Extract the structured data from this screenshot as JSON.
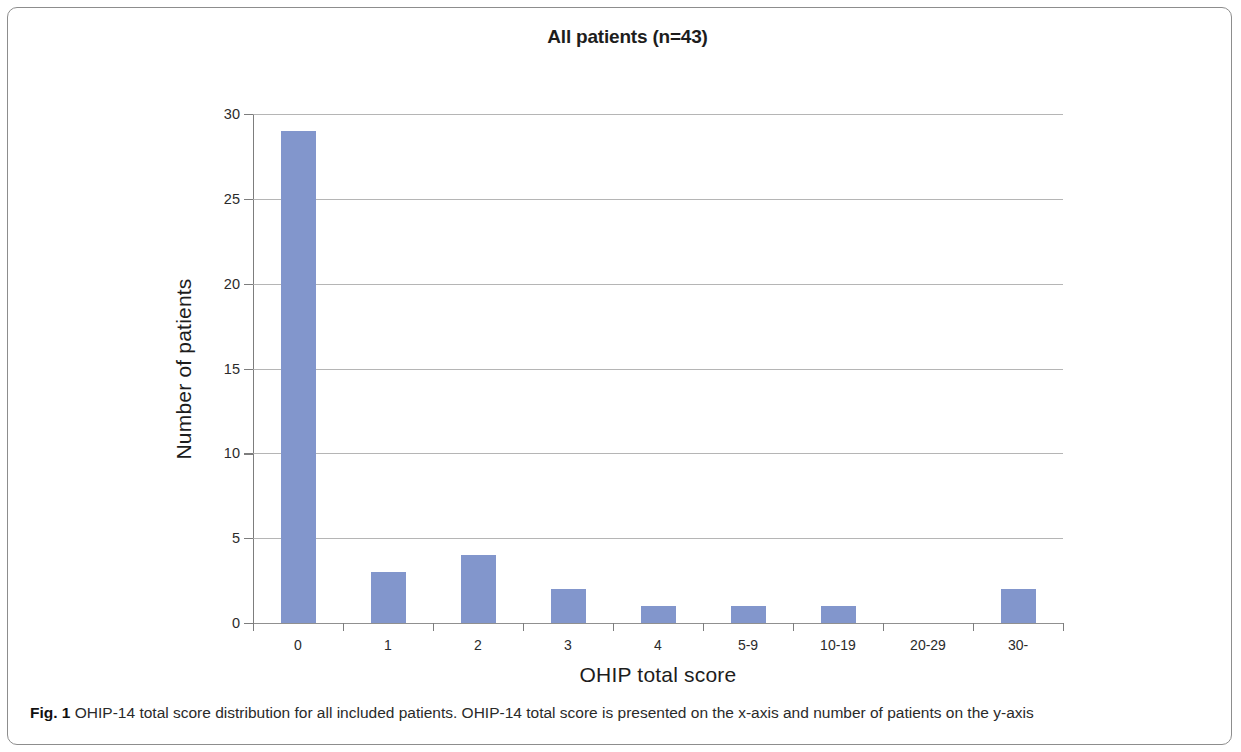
{
  "figure": {
    "caption_label": "Fig. 1",
    "caption_text": " OHIP-14 total score distribution for all included patients. OHIP-14 total score is presented on the x-axis and number of patients on the y-axis"
  },
  "chart_data": {
    "type": "bar",
    "title": "All patients (n=43)",
    "xlabel": "OHIP total score",
    "ylabel": "Number of patients",
    "categories": [
      "0",
      "1",
      "2",
      "3",
      "4",
      "5-9",
      "10-19",
      "20-29",
      "30-"
    ],
    "values": [
      29,
      3,
      4,
      2,
      1,
      1,
      1,
      0,
      2
    ],
    "ylim": [
      0,
      30
    ],
    "ytick_labels": [
      "0",
      "5",
      "10",
      "15",
      "20",
      "25",
      "30"
    ],
    "yticks": [
      0,
      5,
      10,
      15,
      20,
      25,
      30
    ],
    "grid": "horizontal",
    "legend": "none",
    "bar_color": "#8296cc",
    "grid_color": "#a8a8a8",
    "axis_color": "#7d7d7d"
  }
}
